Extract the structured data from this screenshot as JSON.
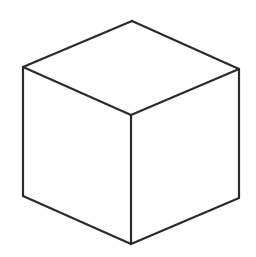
{
  "figure": {
    "projection": "isometric",
    "style": "wireframe-outline",
    "background_color": "#ffffff",
    "stroke_color": "#2b2b2b",
    "fill_color": "#ffffff",
    "stroke_width": 2.2,
    "canvas": {
      "width": 256,
      "height": 257
    }
  },
  "geometry": {
    "vertices": {
      "top_apex": {
        "name": "top-apex",
        "x": 132,
        "y": 21
      },
      "top_left": {
        "name": "top-left",
        "x": 23,
        "y": 67
      },
      "top_right": {
        "name": "top-right",
        "x": 239,
        "y": 69
      },
      "center": {
        "name": "center-junction",
        "x": 131,
        "y": 115
      },
      "bottom_left": {
        "name": "bottom-left",
        "x": 23,
        "y": 196
      },
      "bottom_right": {
        "name": "bottom-right",
        "x": 239,
        "y": 198
      },
      "bottom_front": {
        "name": "bottom-front",
        "x": 131,
        "y": 244
      }
    },
    "faces": [
      {
        "name": "top-face",
        "label": "Top face",
        "points": "132,21 23,67 131,115 239,69"
      },
      {
        "name": "left-face",
        "label": "Left face",
        "points": "23,67 23,196 131,244 131,115"
      },
      {
        "name": "right-face",
        "label": "Right face",
        "points": "131,115 131,244 239,198 239,69"
      }
    ],
    "edges": [
      {
        "name": "edge-apex-to-top-left",
        "d": "M132,21 L23,67"
      },
      {
        "name": "edge-apex-to-top-right",
        "d": "M132,21 L239,69"
      },
      {
        "name": "edge-top-left-to-center",
        "d": "M23,67 L131,115"
      },
      {
        "name": "edge-top-right-to-center",
        "d": "M239,69 L131,115"
      },
      {
        "name": "edge-left-vertical",
        "d": "M23,67 L23,196"
      },
      {
        "name": "edge-right-vertical",
        "d": "M239,69 L239,198"
      },
      {
        "name": "edge-center-vertical",
        "d": "M131,115 L131,244"
      },
      {
        "name": "edge-bottom-left-to-front",
        "d": "M23,196 L131,244"
      },
      {
        "name": "edge-bottom-right-to-front",
        "d": "M239,198 L131,244"
      }
    ]
  }
}
